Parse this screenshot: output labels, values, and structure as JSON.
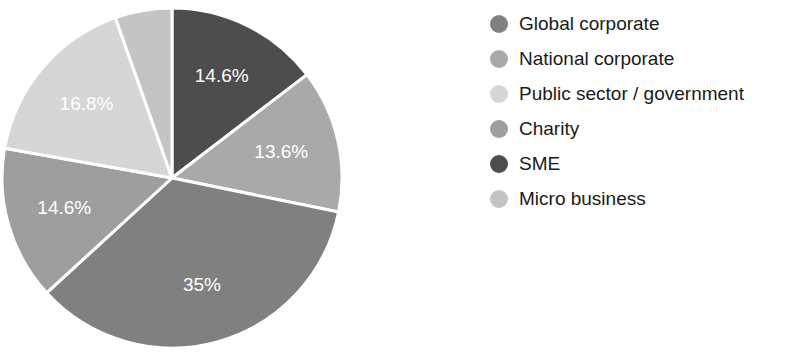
{
  "chart_data": {
    "type": "pie",
    "title": "",
    "subtitle": "",
    "xlabel": "",
    "ylabel": "",
    "legend_position": "right",
    "grid": false,
    "start_angle_deg": 0,
    "direction": "clockwise",
    "categories": [
      "Global corporate",
      "National corporate",
      "Public sector / government",
      "Charity",
      "SME",
      "Micro business"
    ],
    "values": [
      35,
      13.6,
      16.8,
      14.6,
      14.6,
      5.4
    ],
    "labels": [
      "35%",
      "13.6%",
      "16.8%",
      "14.6%",
      "14.6%",
      ""
    ],
    "colors": [
      "#808080",
      "#a9a9a9",
      "#d6d6d6",
      "#9e9e9e",
      "#4d4d4d",
      "#c4c4c4"
    ],
    "slices": [
      {
        "name": "SME",
        "value": 14.6,
        "label": "14.6%",
        "color": "#4d4d4d",
        "order": 1,
        "label_visible": true
      },
      {
        "name": "National corporate",
        "value": 13.6,
        "label": "13.6%",
        "color": "#a9a9a9",
        "order": 2,
        "label_visible": true
      },
      {
        "name": "Global corporate",
        "value": 35,
        "label": "35%",
        "color": "#808080",
        "order": 3,
        "label_visible": true
      },
      {
        "name": "Charity",
        "value": 14.6,
        "label": "14.6%",
        "color": "#9e9e9e",
        "order": 4,
        "label_visible": true
      },
      {
        "name": "Public sector / government",
        "value": 16.8,
        "label": "16.8%",
        "color": "#d6d6d6",
        "order": 5,
        "label_visible": true
      },
      {
        "name": "Micro business",
        "value": 5.4,
        "label": "",
        "color": "#c4c4c4",
        "order": 6,
        "label_visible": false
      }
    ]
  },
  "legend": {
    "items": [
      {
        "label": "Global corporate",
        "color": "#808080"
      },
      {
        "label": "National corporate",
        "color": "#a9a9a9"
      },
      {
        "label": "Public sector / government",
        "color": "#d6d6d6"
      },
      {
        "label": "Charity",
        "color": "#9e9e9e"
      },
      {
        "label": "SME",
        "color": "#4d4d4d"
      },
      {
        "label": "Micro business",
        "color": "#c4c4c4"
      }
    ]
  },
  "pie_geometry": {
    "center_x": 172,
    "center_y": 178,
    "radius": 170,
    "separator_color": "#ffffff",
    "separator_width": 3
  }
}
